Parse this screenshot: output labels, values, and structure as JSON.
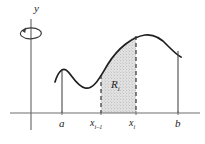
{
  "figure": {
    "kind": "calculus-solid-of-revolution-diagram",
    "background_color": "#ffffff",
    "ink_color": "#262626",
    "axis_color": "#6b6b6b",
    "shade_fill_color": "#d9d9d9",
    "shade_dot_color": "#8a8a8a"
  },
  "axes": {
    "y_axis_label": "y",
    "x_axis": {
      "y_px": 113,
      "x_start_px": 10,
      "x_end_px": 200
    },
    "y_axis": {
      "x_px": 31,
      "y_top_px": 18,
      "y_bottom_px": 130
    }
  },
  "revolution_arrow": {
    "icon_name": "rotation-arrow-icon",
    "description": "elliptical arrow encircling the y-axis indicating revolution about the y-axis",
    "center_x_px": 31,
    "center_y_px": 33,
    "radius_x_px": 11,
    "radius_y_px": 5
  },
  "tick_labels": [
    {
      "name": "a",
      "text": "a",
      "sub": "",
      "x_px": 62
    },
    {
      "name": "x-i-minus-1",
      "text": "x",
      "sub": "i–1",
      "x_px": 101
    },
    {
      "name": "x-i",
      "text": "x",
      "sub": "i",
      "x_px": 136
    },
    {
      "name": "b",
      "text": "b",
      "sub": "",
      "x_px": 178
    }
  ],
  "region": {
    "label_text": "R",
    "label_sub": "i",
    "left_boundary_x_px": 101,
    "right_boundary_x_px": 136,
    "boundary_style": "dashed",
    "fill_style": "stippled"
  },
  "curve": {
    "description": "smooth function y = f(x): rises to a small local maximum, dips to a local minimum, climbs steeply to a tall global maximum, then falls",
    "path": "M 55 82 C 58 72, 62 68, 66 70 C 71 73, 76 86, 85 88 C 94 90, 100 77, 108 64 C 118 48, 132 37, 145 35 C 154 34, 162 39, 168 46 C 173 51, 177 55, 181 57",
    "local_max_px": [
      66,
      70
    ],
    "local_min_px": [
      85,
      88
    ],
    "global_max_px": [
      147,
      35
    ],
    "start_px": [
      55,
      82
    ],
    "end_px": [
      181,
      57
    ]
  },
  "ordinates": [
    {
      "name": "ordinate-at-a",
      "x_px": 62,
      "y_top_px": 71,
      "dashed": false
    },
    {
      "name": "ordinate-at-x-i-m-1",
      "x_px": 101,
      "y_top_px": 75,
      "dashed": true
    },
    {
      "name": "ordinate-at-x-i",
      "x_px": 136,
      "y_top_px": 36,
      "dashed": true
    },
    {
      "name": "ordinate-at-b",
      "x_px": 178,
      "y_top_px": 51,
      "dashed": false
    }
  ]
}
